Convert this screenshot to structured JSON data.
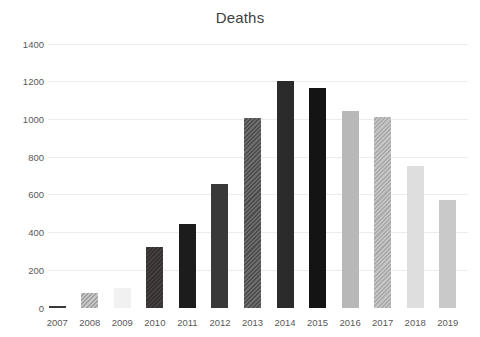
{
  "chart_data": {
    "type": "bar",
    "title": "Deaths",
    "xlabel": "",
    "ylabel": "",
    "legend": "none",
    "grid": "horizontal-light",
    "background_color": "#ffffff",
    "title_color": "#404040",
    "axis_text_color": "#595959",
    "gridline_color": "#ececec",
    "ylim": [
      0,
      1400
    ],
    "ytick_interval": 200,
    "yticks": [
      0,
      200,
      400,
      600,
      800,
      1000,
      1200,
      1400
    ],
    "categories": [
      "2007",
      "2008",
      "2009",
      "2010",
      "2011",
      "2012",
      "2013",
      "2014",
      "2015",
      "2016",
      "2017",
      "2018",
      "2019"
    ],
    "values": [
      12,
      80,
      105,
      325,
      445,
      660,
      1010,
      1205,
      1165,
      1045,
      1015,
      755,
      575
    ],
    "bar_styles": [
      {
        "pattern": "solid",
        "color": "#3a3a3a",
        "color2": ""
      },
      {
        "pattern": "diagonal-hatch",
        "color": "#c7c7c7",
        "color2": "#9f9f9f"
      },
      {
        "pattern": "solid",
        "color": "#f1f1f1",
        "color2": ""
      },
      {
        "pattern": "diagonal-hatch",
        "color": "#454040",
        "color2": "#332f2f"
      },
      {
        "pattern": "solid",
        "color": "#1c1c1c",
        "color2": ""
      },
      {
        "pattern": "solid",
        "color": "#393939",
        "color2": ""
      },
      {
        "pattern": "diagonal-hatch",
        "color": "#6e6e6e",
        "color2": "#4c4c4c"
      },
      {
        "pattern": "solid",
        "color": "#2b2b2b",
        "color2": ""
      },
      {
        "pattern": "solid",
        "color": "#141414",
        "color2": ""
      },
      {
        "pattern": "solid",
        "color": "#b8b8b8",
        "color2": ""
      },
      {
        "pattern": "diagonal-hatch",
        "color": "#c6c6c6",
        "color2": "#a9a9a9"
      },
      {
        "pattern": "solid",
        "color": "#dedede",
        "color2": ""
      },
      {
        "pattern": "solid",
        "color": "#c9c9c9",
        "color2": ""
      }
    ]
  }
}
